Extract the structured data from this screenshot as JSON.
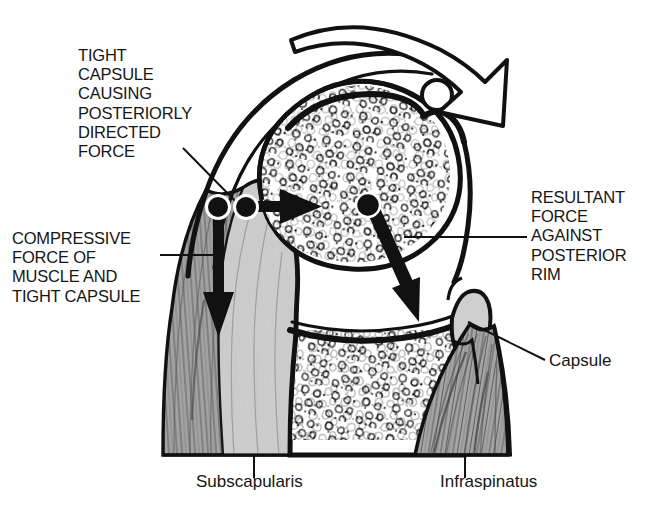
{
  "figure": {
    "background_color": "#ffffff",
    "ink_color": "#111111",
    "muscle_fill": "#9a9a9a",
    "capsule_fill": "#c9c9c9",
    "bone_fill": "#ffffff",
    "width": 658,
    "height": 511
  },
  "labels": {
    "tight_capsule": "TIGHT\nCAPSULE\nCAUSING\nPOSTERIORLY\nDIRECTED\nFORCE",
    "compressive_force": "COMPRESSIVE\nFORCE OF\nMUSCLE AND\nTIGHT CAPSULE",
    "resultant_force": "RESULTANT\nFORCE\nAGAINST\nPOSTERIOR\nRIM",
    "capsule": "Capsule",
    "subscapularis": "Subscapularis",
    "infraspinatus": "Infraspinatus"
  },
  "annotations": {
    "rotation_arrow": "curved-open-arrow-posterior-rotation",
    "posterior_force_arrow": "solid-arrow-pointing-right",
    "compressive_force_arrow": "solid-arrow-pointing-down",
    "resultant_force_arrow": "solid-arrow-pointing-down-right",
    "force_origin_dots": 3,
    "humeral_head_marker": "small-open-circle"
  }
}
